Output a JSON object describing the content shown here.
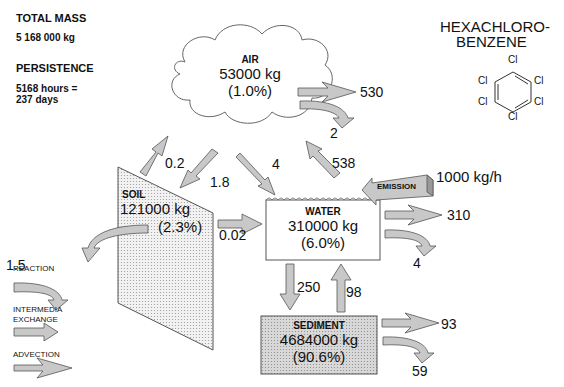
{
  "summary": {
    "total_mass_label": "TOTAL MASS",
    "total_mass_value": "5 168 000 kg",
    "persistence_label": "PERSISTENCE",
    "persistence_line1": "5168 hours =",
    "persistence_line2": "237 days"
  },
  "chemical": {
    "name_line1": "HEXACHLORO-",
    "name_line2": "BENZENE",
    "substituent": "Cl"
  },
  "compartments": {
    "air": {
      "label": "AIR",
      "mass": "53000 kg",
      "percent": "(1.0%)"
    },
    "soil": {
      "label": "SOIL",
      "mass": "121000 kg",
      "percent": "(2.3%)"
    },
    "water": {
      "label": "WATER",
      "mass": "310000 kg",
      "percent": "(6.0%)"
    },
    "sediment": {
      "label": "SEDIMENT",
      "mass": "4684000 kg",
      "percent": "(90.6%)"
    }
  },
  "emission": {
    "label": "EMISSION",
    "rate": "1000 kg/h"
  },
  "flows": {
    "air_advection": "530",
    "air_reaction": "2",
    "soil_to_air": "0.2",
    "air_to_soil": "1.8",
    "air_to_water": "4",
    "water_to_air": "538",
    "soil_to_water": "0.02",
    "soil_reaction": "1.5",
    "water_advection": "310",
    "water_reaction": "4",
    "water_to_sediment": "250",
    "sediment_to_water": "98",
    "sediment_advection": "93",
    "sediment_reaction": "59"
  },
  "legend": {
    "reaction": "REACTION",
    "intermedia_line1": "INTERMEDIA",
    "intermedia_line2": "EXCHANGE",
    "advection": "ADVECTION"
  },
  "colors": {
    "arrow_fill": "#c8c8c8",
    "arrow_stroke": "#555555",
    "sediment_fill": "#d4d4d4"
  }
}
